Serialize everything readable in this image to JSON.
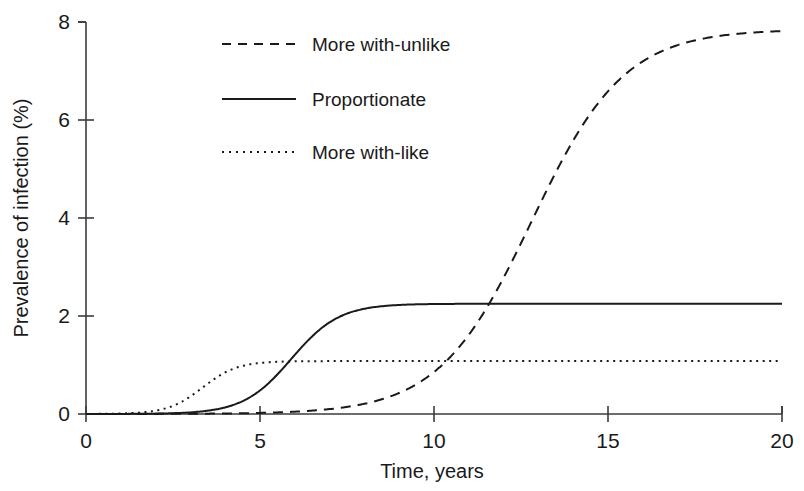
{
  "chart_data": {
    "type": "line",
    "title": "",
    "xlabel": "Time, years",
    "ylabel": "Prevalence of infection (%)",
    "xlim": [
      0,
      20
    ],
    "ylim": [
      0,
      8
    ],
    "xticks": [
      0,
      5,
      10,
      15,
      20
    ],
    "yticks": [
      0,
      2,
      4,
      6,
      8
    ],
    "xtick_labels": [
      "0",
      "5",
      "10",
      "15",
      "20"
    ],
    "ytick_labels": [
      "0",
      "2",
      "4",
      "6",
      "8"
    ],
    "grid": false,
    "legend_position": "upper-left-inset",
    "series": [
      {
        "name": "More with-unlike",
        "style": "dashed",
        "color": "#1a1a1a",
        "plateau": 7.85,
        "midpoint_year": 12.8,
        "steepness": 0.75,
        "x": [
          0,
          1,
          2,
          3,
          4,
          5,
          6,
          7,
          8,
          8.5,
          9,
          9.5,
          10,
          10.5,
          11,
          11.5,
          12,
          12.5,
          13,
          13.5,
          14,
          14.5,
          15,
          15.5,
          16,
          17,
          18,
          19,
          20
        ],
        "values": [
          0.0,
          0.0,
          0.0,
          0.0,
          0.0,
          0.01,
          0.02,
          0.05,
          0.11,
          0.16,
          0.23,
          0.34,
          0.49,
          0.7,
          1.0,
          1.41,
          1.96,
          2.66,
          3.5,
          4.42,
          5.31,
          6.08,
          6.68,
          7.1,
          7.39,
          7.69,
          7.79,
          7.83,
          7.85
        ]
      },
      {
        "name": "Proportionate",
        "style": "solid",
        "color": "#1a1a1a",
        "plateau": 2.25,
        "midpoint_year": 5.9,
        "steepness": 1.45,
        "x": [
          0,
          1,
          2,
          3,
          3.5,
          4,
          4.5,
          5,
          5.25,
          5.5,
          5.75,
          6,
          6.25,
          6.5,
          6.75,
          7,
          7.5,
          8,
          9,
          10,
          12,
          14,
          16,
          18,
          20
        ],
        "values": [
          0.0,
          0.0,
          0.0,
          0.02,
          0.05,
          0.1,
          0.19,
          0.38,
          0.52,
          0.7,
          0.92,
          1.14,
          1.37,
          1.58,
          1.76,
          1.9,
          2.08,
          2.17,
          2.22,
          2.23,
          2.24,
          2.25,
          2.25,
          2.25,
          2.25
        ]
      },
      {
        "name": "More with-like",
        "style": "dotted",
        "color": "#1a1a1a",
        "plateau": 1.08,
        "midpoint_year": 3.35,
        "steepness": 2.0,
        "x": [
          0,
          1,
          2,
          2.25,
          2.5,
          2.75,
          3,
          3.25,
          3.5,
          3.75,
          4,
          4.25,
          4.5,
          5,
          5.5,
          6,
          7,
          8,
          10,
          12,
          14,
          16,
          18,
          20
        ],
        "values": [
          0.0,
          0.0,
          0.02,
          0.04,
          0.07,
          0.13,
          0.23,
          0.38,
          0.58,
          0.75,
          0.88,
          0.96,
          1.01,
          1.05,
          1.07,
          1.08,
          1.08,
          1.08,
          1.08,
          1.08,
          1.08,
          1.08,
          1.08,
          1.08
        ]
      }
    ]
  },
  "legend": {
    "items": [
      {
        "label": "More with-unlike",
        "style": "dashed"
      },
      {
        "label": "Proportionate",
        "style": "solid"
      },
      {
        "label": "More with-like",
        "style": "dotted"
      }
    ]
  }
}
